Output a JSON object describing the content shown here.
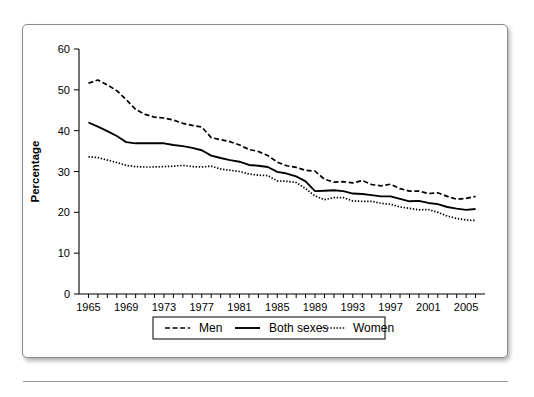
{
  "chart_data": {
    "type": "line",
    "title": "",
    "xlabel": "Year",
    "ylabel": "Percentage",
    "xlim": [
      1964,
      2007
    ],
    "ylim": [
      0,
      60
    ],
    "yticks": [
      0,
      10,
      20,
      30,
      40,
      50,
      60
    ],
    "xticks_labeled": [
      1965,
      1969,
      1973,
      1977,
      1981,
      1985,
      1989,
      1993,
      1997,
      2001,
      2005
    ],
    "xtick_minor_step": 1,
    "grid": false,
    "legend_position": "bottom-center",
    "x": [
      1965,
      1966,
      1967,
      1968,
      1969,
      1970,
      1971,
      1972,
      1973,
      1974,
      1975,
      1976,
      1977,
      1978,
      1979,
      1980,
      1981,
      1982,
      1983,
      1984,
      1985,
      1986,
      1987,
      1988,
      1989,
      1990,
      1991,
      1992,
      1993,
      1994,
      1995,
      1996,
      1997,
      1998,
      1999,
      2000,
      2001,
      2002,
      2003,
      2004,
      2005,
      2006
    ],
    "series": [
      {
        "name": "Men",
        "style": "dashed",
        "values": [
          51.6,
          52.4,
          51.2,
          49.8,
          47.6,
          45.2,
          44.0,
          43.3,
          43.1,
          42.6,
          41.8,
          41.3,
          40.9,
          38.3,
          37.8,
          37.3,
          36.5,
          35.4,
          34.9,
          33.9,
          32.3,
          31.4,
          31.0,
          30.3,
          30.1,
          28.1,
          27.4,
          27.5,
          27.2,
          27.8,
          26.8,
          26.5,
          26.9,
          25.8,
          25.2,
          25.2,
          24.6,
          24.8,
          23.9,
          23.2,
          23.4,
          23.9
        ]
      },
      {
        "name": "Both sexes",
        "style": "solid",
        "values": [
          42.0,
          41.0,
          39.9,
          38.7,
          37.2,
          36.9,
          36.9,
          36.9,
          36.9,
          36.5,
          36.2,
          35.8,
          35.2,
          33.9,
          33.3,
          32.8,
          32.4,
          31.6,
          31.4,
          31.1,
          29.9,
          29.5,
          28.8,
          27.6,
          25.2,
          25.3,
          25.4,
          25.2,
          24.6,
          24.5,
          24.2,
          23.9,
          23.9,
          23.3,
          22.7,
          22.8,
          22.3,
          22.0,
          21.3,
          20.9,
          20.6,
          20.8
        ]
      },
      {
        "name": "Women",
        "style": "dotted",
        "values": [
          33.6,
          33.4,
          32.8,
          32.2,
          31.5,
          31.2,
          31.1,
          31.1,
          31.2,
          31.3,
          31.5,
          31.2,
          31.1,
          31.3,
          30.6,
          30.3,
          30.0,
          29.4,
          29.1,
          29.0,
          27.7,
          27.6,
          27.3,
          25.8,
          24.0,
          23.1,
          23.6,
          23.6,
          22.8,
          22.7,
          22.7,
          22.2,
          22.0,
          21.3,
          21.0,
          20.6,
          20.7,
          20.0,
          19.1,
          18.5,
          18.1,
          18.0
        ]
      }
    ]
  },
  "legend": {
    "items": [
      {
        "label": "Men",
        "style": "dashed"
      },
      {
        "label": "Both sexes",
        "style": "solid"
      },
      {
        "label": "Women",
        "style": "dotted"
      }
    ]
  }
}
